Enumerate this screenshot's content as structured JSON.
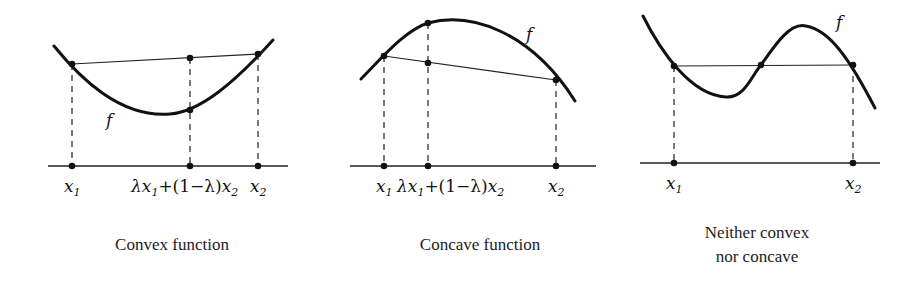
{
  "panels": [
    {
      "id": "convex",
      "caption_lines": [
        "Convex function"
      ],
      "caption_x": 172,
      "caption_y": [
        250
      ],
      "curve_label": "f",
      "curve_label_pos": [
        106,
        126
      ],
      "curve_path": "M54,46 C80,78 120,118 170,114 C200,112 235,82 273,40",
      "chord": [
        [
          72,
          64
        ],
        [
          258,
          54
        ]
      ],
      "axis": {
        "x1": 48,
        "x2": 288,
        "y": 166
      },
      "dots": [
        [
          72,
          64
        ],
        [
          190,
          58
        ],
        [
          190,
          110
        ],
        [
          258,
          54
        ],
        [
          72,
          166
        ],
        [
          190,
          166
        ],
        [
          258,
          166
        ]
      ],
      "dashes": [
        [
          72,
          64,
          72,
          166
        ],
        [
          190,
          58,
          190,
          166
        ],
        [
          258,
          54,
          258,
          166
        ]
      ],
      "tick_labels": [
        {
          "text": "x",
          "sub": "1",
          "x": 64,
          "y": 192
        },
        {
          "text": "λx",
          "sub": "1",
          "after": "+(1−λ)x",
          "sub2": "2",
          "x": 131,
          "y": 192
        },
        {
          "text": "x",
          "sub": "2",
          "x": 250,
          "y": 192
        }
      ]
    },
    {
      "id": "concave",
      "caption_lines": [
        "Concave function"
      ],
      "caption_x": 480,
      "caption_y": [
        250
      ],
      "curve_label": "f",
      "curve_label_pos": [
        526,
        40
      ],
      "curve_path": "M361,79 C380,60 405,30 428,23 C470,12 530,30 575,101",
      "chord": [
        [
          384,
          56
        ],
        [
          556,
          80
        ]
      ],
      "axis": {
        "x1": 350,
        "x2": 596,
        "y": 166
      },
      "dots": [
        [
          384,
          56
        ],
        [
          428,
          23
        ],
        [
          428,
          63
        ],
        [
          556,
          80
        ],
        [
          384,
          166
        ],
        [
          428,
          166
        ],
        [
          556,
          166
        ]
      ],
      "dashes": [
        [
          384,
          56,
          384,
          166
        ],
        [
          428,
          23,
          428,
          166
        ],
        [
          556,
          80,
          556,
          166
        ]
      ],
      "tick_labels": [
        {
          "text": "x",
          "sub": "1",
          "x": 376,
          "y": 192
        },
        {
          "text": "λx",
          "sub": "1",
          "after": "+(1−λ)x",
          "sub2": "2",
          "x": 397,
          "y": 192
        },
        {
          "text": "x",
          "sub": "2",
          "x": 548,
          "y": 192
        }
      ]
    },
    {
      "id": "neither",
      "caption_lines": [
        "Neither convex",
        "nor concave"
      ],
      "caption_x": 757,
      "caption_y": [
        238,
        262
      ],
      "curve_label": "f",
      "curve_label_pos": [
        836,
        28
      ],
      "curve_path": "M643,16 C660,50 690,95 726,97 C745,98 752,75 761,65 C775,45 790,22 806,26 C830,30 850,60 875,108",
      "chord": [
        [
          674,
          66
        ],
        [
          853,
          65
        ]
      ],
      "axis": {
        "x1": 640,
        "x2": 880,
        "y": 163
      },
      "dots": [
        [
          674,
          66
        ],
        [
          761,
          65
        ],
        [
          853,
          65
        ],
        [
          674,
          163
        ],
        [
          853,
          163
        ]
      ],
      "dashes": [
        [
          674,
          66,
          674,
          163
        ],
        [
          853,
          65,
          853,
          163
        ]
      ],
      "tick_labels": [
        {
          "text": "x",
          "sub": "1",
          "x": 666,
          "y": 189
        },
        {
          "text": "x",
          "sub": "2",
          "x": 845,
          "y": 189
        }
      ]
    }
  ]
}
